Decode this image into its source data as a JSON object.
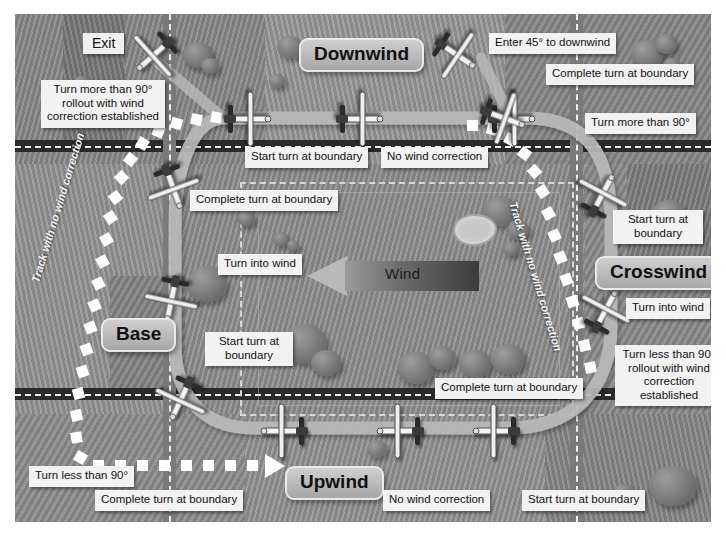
{
  "diagram": {
    "colors": {
      "ground": "#8f8f8f",
      "road_dark": "#2a2a2a",
      "road_light": "#7d7d7d",
      "track_ribbon": "#b4b4b4",
      "no_wind_track": "#ffffff",
      "callout_bg": "#f2f2f2",
      "plate_text": "#111111"
    }
  },
  "wind": {
    "label": "Wind",
    "direction": "right-to-left"
  },
  "legs": [
    {
      "name": "downwind-plate",
      "label": "Downwind"
    },
    {
      "name": "crosswind-plate",
      "label": "Crosswind"
    },
    {
      "name": "base-plate",
      "label": "Base"
    },
    {
      "name": "upwind-plate",
      "label": "Upwind"
    }
  ],
  "exit": {
    "label": "Exit"
  },
  "track_annotations": [
    {
      "name": "track-label-left",
      "label": "Track with no wind correction"
    },
    {
      "name": "track-label-right",
      "label": "Track with no wind correction"
    }
  ],
  "callouts": [
    {
      "name": "callout-turn-more-90-rollout",
      "text": "Turn more than 90° rollout with wind correction established"
    },
    {
      "name": "callout-start-turn-boundary-downwind",
      "text": "Start turn at boundary"
    },
    {
      "name": "callout-no-wind-correction-downwind",
      "text": "No wind correction"
    },
    {
      "name": "callout-complete-turn-boundary-base-upper",
      "text": "Complete turn at boundary"
    },
    {
      "name": "callout-turn-into-wind-left",
      "text": "Turn into wind"
    },
    {
      "name": "callout-start-turn-boundary-base",
      "text": "Start turn at boundary"
    },
    {
      "name": "callout-turn-less-90",
      "text": "Turn less than 90°"
    },
    {
      "name": "callout-complete-turn-boundary-upwind-left",
      "text": "Complete turn at boundary"
    },
    {
      "name": "callout-no-wind-correction-upwind",
      "text": "No wind correction"
    },
    {
      "name": "callout-start-turn-boundary-upwind",
      "text": "Start turn at boundary"
    },
    {
      "name": "callout-complete-turn-boundary-crosswind-lower",
      "text": "Complete turn at boundary"
    },
    {
      "name": "callout-turn-less-90-rollout",
      "text": "Turn less than 90° rollout with wind correction established"
    },
    {
      "name": "callout-turn-into-wind-right",
      "text": "Turn into wind"
    },
    {
      "name": "callout-start-turn-boundary-crosswind",
      "text": "Start turn at boundary"
    },
    {
      "name": "callout-turn-more-90",
      "text": "Turn more than 90°"
    },
    {
      "name": "callout-complete-turn-boundary-downwind-right",
      "text": "Complete turn at boundary"
    },
    {
      "name": "callout-enter-45-downwind",
      "text": "Enter 45° to downwind"
    }
  ],
  "aircraft": [
    {
      "name": "aircraft-exit",
      "leg": "exit"
    },
    {
      "name": "aircraft-downwind-1",
      "leg": "downwind"
    },
    {
      "name": "aircraft-downwind-2",
      "leg": "downwind"
    },
    {
      "name": "aircraft-downwind-3",
      "leg": "downwind"
    },
    {
      "name": "aircraft-entry-45",
      "leg": "entry"
    },
    {
      "name": "aircraft-downwind-4",
      "leg": "downwind"
    },
    {
      "name": "aircraft-crosswind-1",
      "leg": "crosswind"
    },
    {
      "name": "aircraft-crosswind-2",
      "leg": "crosswind"
    },
    {
      "name": "aircraft-base-1",
      "leg": "base"
    },
    {
      "name": "aircraft-base-2",
      "leg": "base"
    },
    {
      "name": "aircraft-base-3",
      "leg": "base"
    },
    {
      "name": "aircraft-upwind-1",
      "leg": "upwind"
    },
    {
      "name": "aircraft-upwind-2",
      "leg": "upwind"
    },
    {
      "name": "aircraft-upwind-3",
      "leg": "upwind"
    }
  ]
}
